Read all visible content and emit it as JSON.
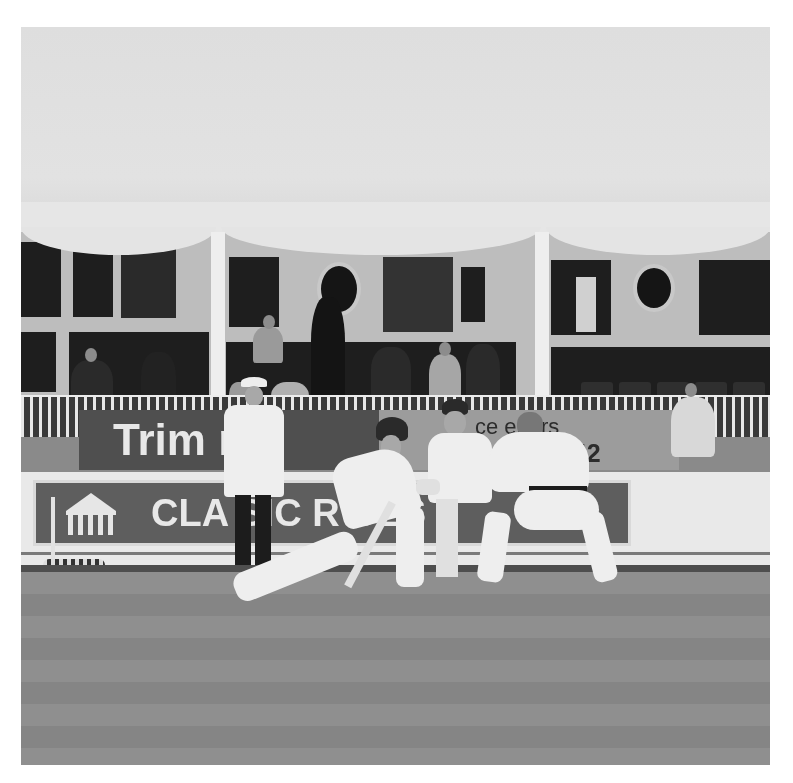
{
  "image": {
    "type": "photograph",
    "color_mode": "grayscale",
    "subject": "cricket match — batsman playing a sweep shot with wicketkeeper and close fielder, umpire standing behind",
    "colors": {
      "canopy": "#e0e0e0",
      "pavilion_wall": "#bdbdbd",
      "field": "#8a8a8a",
      "ad_board_dark": "#4f4f4f",
      "border": "#ffffff"
    }
  },
  "signage": {
    "board_left_text": "Trimline",
    "board_left_visible": "Trim   me",
    "board_right_line1": "ce   eriors",
    "board_right_line2": "4242",
    "board_lower_text": "CLASSIC ROSES",
    "board_lower_visible": "CLA   SIC   R   SES"
  },
  "scene": {
    "figures": [
      {
        "role": "umpire",
        "attire": "white coat, white hat, dark trousers"
      },
      {
        "role": "batsman",
        "attire": "whites, pads, dark helmet",
        "pose": "sweep shot, front leg stretched"
      },
      {
        "role": "wicketkeeper",
        "attire": "whites, dark cap"
      },
      {
        "role": "close-fielder",
        "attire": "whites",
        "pose": "crouching, back to camera"
      }
    ],
    "background": "pavilion with spectators under a white marquee canopy"
  }
}
